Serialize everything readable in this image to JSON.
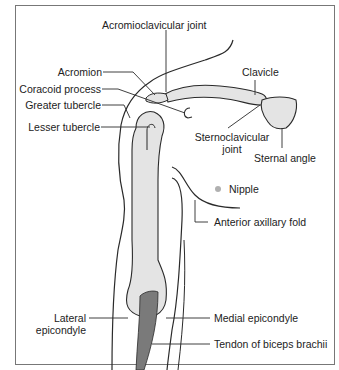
{
  "diagram": {
    "colors": {
      "outline": "#2a2a2a",
      "bone_fill": "#e4e4e4",
      "tendon_fill": "#7a7a7a",
      "frame_border": "#777777",
      "nipple": "#b0b0b0"
    },
    "labels": {
      "acromioclavicular_joint": "Acromioclavicular joint",
      "acromion": "Acromion",
      "coracoid_process": "Coracoid process",
      "greater_tubercle": "Greater tubercle",
      "lesser_tubercle": "Lesser tubercle",
      "clavicle": "Clavicle",
      "sternoclavicular_joint_line1": "Sternoclavicular",
      "sternoclavicular_joint_line2": "joint",
      "sternal_angle": "Sternal angle",
      "nipple": "Nipple",
      "anterior_axillary_fold": "Anterior axillary fold",
      "lateral_epicondyle_line1": "Lateral",
      "lateral_epicondyle_line2": "epicondyle",
      "medial_epicondyle": "Medial epicondyle",
      "tendon_of_biceps_brachii": "Tendon of biceps brachii"
    }
  }
}
